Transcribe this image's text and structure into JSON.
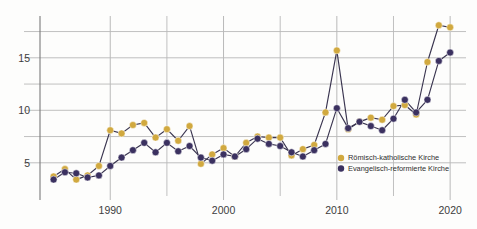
{
  "chart": {
    "type": "line",
    "background_color": "#fdfdfc",
    "grid_color": "#b9b9b9",
    "axis_color": "#7a7a7a",
    "line_color": "#3a3550"
  },
  "legend": {
    "position": "inside-right-lower",
    "entries": [
      {
        "label": "Römisch-katholische Kirche",
        "color": "#d1a93f",
        "marker": "circle"
      },
      {
        "label": "Evangelisch-reformierte Kirche",
        "color": "#3b3160",
        "marker": "circle"
      }
    ]
  },
  "axes": {
    "y": {
      "ticks_labeled": [
        "5",
        "10",
        "15"
      ],
      "tick_values": [
        5,
        10,
        15
      ],
      "gridline_values": [
        5,
        7.5,
        10,
        12.5,
        15,
        17.5
      ],
      "min": 2.6,
      "max": 18.6
    },
    "x": {
      "ticks_labeled": [
        "1990",
        "2000",
        "2010",
        "2020"
      ],
      "tick_values": [
        1990,
        2000,
        2010,
        2020
      ],
      "minor_tick_values": [
        1995,
        2005,
        2015
      ],
      "min": 1983.8,
      "max": 2021.4
    }
  },
  "chart_data": {
    "type": "line",
    "title": "",
    "subtitle": "",
    "xlabel": "",
    "ylabel": "",
    "xlim": [
      1983.8,
      2021.4
    ],
    "ylim": [
      2.6,
      18.6
    ],
    "grid": true,
    "legend_position": "inside-right-lower",
    "x": [
      1985,
      1986,
      1987,
      1988,
      1989,
      1990,
      1991,
      1992,
      1993,
      1994,
      1995,
      1996,
      1997,
      1998,
      1999,
      2000,
      2001,
      2002,
      2003,
      2004,
      2005,
      2006,
      2007,
      2008,
      2009,
      2010,
      2011,
      2012,
      2013,
      2014,
      2015,
      2016,
      2017,
      2018,
      2019,
      2020
    ],
    "series": [
      {
        "name": "Römisch-katholische Kirche",
        "color": "#d1a93f",
        "values": [
          3.7,
          4.4,
          3.4,
          3.8,
          4.7,
          8.1,
          7.8,
          8.6,
          8.8,
          7.4,
          8.2,
          7.1,
          8.5,
          4.9,
          5.8,
          6.4,
          5.6,
          6.9,
          7.5,
          7.4,
          7.4,
          5.7,
          6.3,
          6.7,
          9.8,
          15.7,
          8.2,
          8.9,
          9.3,
          9.1,
          10.4,
          10.5,
          9.6,
          14.6,
          18.1,
          17.9
        ]
      },
      {
        "name": "Evangelisch-reformierte Kirche",
        "color": "#3b3160",
        "values": [
          3.4,
          4.1,
          4.0,
          3.6,
          3.8,
          4.7,
          5.5,
          6.2,
          6.9,
          6.0,
          6.9,
          6.1,
          6.6,
          5.5,
          5.2,
          5.8,
          5.6,
          6.3,
          7.3,
          6.8,
          6.6,
          6.0,
          5.6,
          6.2,
          6.8,
          10.2,
          8.3,
          8.9,
          8.5,
          8.1,
          9.2,
          11.0,
          9.8,
          11.0,
          14.7,
          15.5
        ]
      }
    ]
  }
}
